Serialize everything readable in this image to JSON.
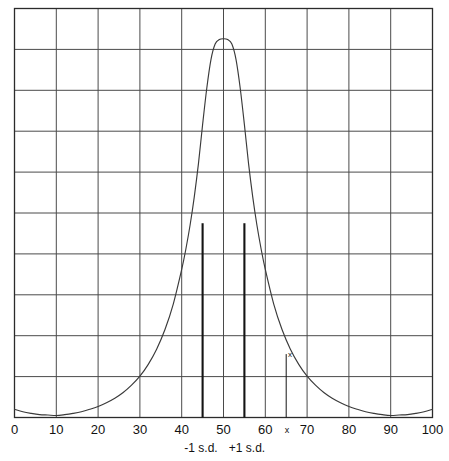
{
  "chart_data": {
    "type": "line",
    "title": "",
    "subtitle": "",
    "xlabel": "",
    "ylabel": "",
    "xlim": [
      0,
      100
    ],
    "ylim": [
      0,
      10
    ],
    "grid": true,
    "grid_x_step": 10,
    "grid_y_divisions": 10,
    "legend": "none",
    "x_tick_labels": [
      "0",
      "10",
      "20",
      "30",
      "40",
      "50",
      "60",
      "70",
      "80",
      "90",
      "100"
    ],
    "x_tick_values": [
      0,
      10,
      20,
      30,
      40,
      50,
      60,
      70,
      80,
      90,
      100
    ],
    "y_tick_labels": [],
    "series": [
      {
        "name": "distribution-curve",
        "description": "Sharply peaked bell-shaped distribution centred at 50 with long flat tails",
        "x": [
          0,
          2,
          4,
          6,
          8,
          10,
          12,
          14,
          16,
          18,
          20,
          22,
          24,
          26,
          28,
          30,
          32,
          34,
          36,
          38,
          40,
          41,
          42,
          43,
          44,
          45,
          46,
          47,
          48,
          49,
          50,
          51,
          52,
          53,
          54,
          55,
          56,
          57,
          58,
          59,
          60,
          62,
          64,
          66,
          68,
          70,
          72,
          74,
          76,
          78,
          80,
          82,
          84,
          86,
          88,
          90,
          92,
          94,
          96,
          98,
          100
        ],
        "y": [
          0.2,
          0.14,
          0.1,
          0.07,
          0.06,
          0.05,
          0.07,
          0.1,
          0.14,
          0.2,
          0.27,
          0.36,
          0.47,
          0.61,
          0.79,
          1.01,
          1.3,
          1.67,
          2.15,
          2.78,
          3.62,
          4.12,
          4.7,
          5.39,
          6.2,
          7.16,
          8.05,
          8.75,
          9.13,
          9.24,
          9.26,
          9.24,
          9.13,
          8.75,
          8.05,
          7.16,
          6.2,
          5.39,
          4.7,
          4.12,
          3.62,
          2.78,
          2.15,
          1.67,
          1.3,
          1.01,
          0.79,
          0.61,
          0.47,
          0.36,
          0.27,
          0.2,
          0.14,
          0.1,
          0.07,
          0.05,
          0.06,
          0.07,
          0.1,
          0.14,
          0.2
        ]
      }
    ],
    "annotations": [
      {
        "name": "minus-one-sd-line",
        "type": "vline",
        "x": 45,
        "y_top": 4.75,
        "label": "-1 s.d.",
        "label_position": "below-axis",
        "style": "thick"
      },
      {
        "name": "plus-one-sd-line",
        "type": "vline",
        "x": 55,
        "y_top": 4.75,
        "label": "+1 s.d.",
        "label_position": "below-axis",
        "style": "thick"
      },
      {
        "name": "x-value-line",
        "type": "vline",
        "x": 65,
        "y_top": 1.55,
        "label": "x",
        "label_position": "below-axis",
        "style": "thin"
      },
      {
        "name": "x-point-marker",
        "type": "point-label",
        "x": 66.5,
        "y": 1.95,
        "label": "x"
      }
    ]
  },
  "axis": {
    "x_labels": [
      {
        "text": "0",
        "value": 0
      },
      {
        "text": "10",
        "value": 10
      },
      {
        "text": "20",
        "value": 20
      },
      {
        "text": "30",
        "value": 30
      },
      {
        "text": "40",
        "value": 40
      },
      {
        "text": "50",
        "value": 50
      },
      {
        "text": "60",
        "value": 60
      },
      {
        "text": "70",
        "value": 70
      },
      {
        "text": "80",
        "value": 80
      },
      {
        "text": "90",
        "value": 90
      },
      {
        "text": "100",
        "value": 100
      }
    ],
    "x_axis_marker": "x"
  },
  "labels": {
    "minus_sd": "-1 s.d.",
    "plus_sd": "+1 s.d.",
    "point_marker": "x"
  },
  "colors": {
    "grid": "#4a4a4a",
    "border": "#2b2b2b",
    "curve": "#3a3a3a",
    "sd_line": "#141414",
    "text": "#111111",
    "background": "#ffffff"
  }
}
